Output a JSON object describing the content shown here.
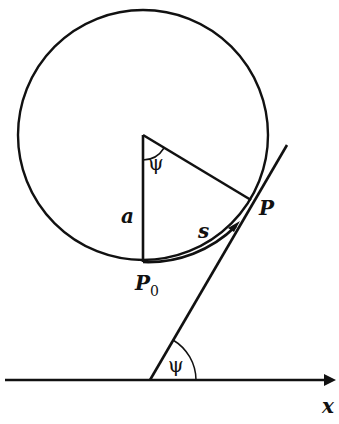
{
  "diagram": {
    "labels": {
      "psi_center": "ψ",
      "psi_axis": "ψ",
      "radius": "a",
      "point_P": "P",
      "point_P0": "P",
      "point_P0_sub": "0",
      "arc_length": "s",
      "axis_x": "x"
    },
    "colors": {
      "stroke": "#111111",
      "background": "#ffffff"
    },
    "geometry": {
      "circle_center": [
        143,
        135
      ],
      "circle_radius": 125,
      "P0": [
        143,
        262
      ],
      "P": [
        251,
        200
      ],
      "tangent_start": [
        150,
        380
      ],
      "tangent_end": [
        287,
        145
      ],
      "x_axis_y": 380
    }
  }
}
